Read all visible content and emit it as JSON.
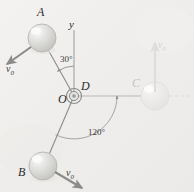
{
  "figure": {
    "background_color": "#f1f0ee",
    "ink_color": "#8d8d8d",
    "label_color": "#2b2b2b",
    "ball_fill": "#d8d8d6",
    "ball_highlight": "#f4f4f2"
  },
  "labels": {
    "ball_a": "A",
    "ball_b": "B",
    "ball_c": "C",
    "hub_d": "D",
    "origin_o": "O",
    "axis_y": "y"
  },
  "velocities": [
    {
      "id": "v0-a",
      "text": "v",
      "sub": "0"
    },
    {
      "id": "v0-b",
      "text": "v",
      "sub": "0"
    },
    {
      "id": "v0-c",
      "text": "v",
      "sub": "0"
    }
  ],
  "angles": {
    "a_from_y": "30°",
    "b_to_c": "120°"
  },
  "geometry": {
    "hub_x": 74,
    "hub_y": 96,
    "ball_a": {
      "cx": 42,
      "cy": 38,
      "r": 14
    },
    "ball_b": {
      "cx": 43,
      "cy": 166,
      "r": 14
    },
    "ball_c": {
      "cx": 155,
      "cy": 96,
      "r": 14
    }
  }
}
